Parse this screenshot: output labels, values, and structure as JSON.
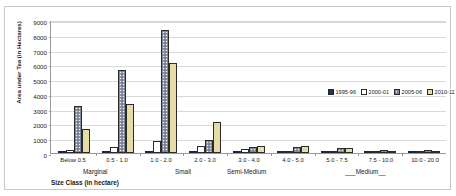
{
  "chart_data": {
    "type": "bar",
    "title": "",
    "xlabel": "Size Class (in hectare)",
    "ylabel": "Area under Tea (in Hectares)",
    "ylim": [
      0,
      9000
    ],
    "ystep": 1000,
    "yticks": [
      "9000",
      "8000",
      "7000",
      "6000",
      "5000",
      "4000",
      "3000",
      "2000",
      "1000",
      "0"
    ],
    "grid": true,
    "legend_position": "middle-right-inside",
    "categories": [
      "Below 0.5",
      "0.5 - 1.0",
      "1.0 - 2.0",
      "2.0 - 3.0",
      "3.0 - 4.0",
      "4.0 - 5.0",
      "5.0 - 7.5",
      "7.5 - 10.0",
      "10.0 - 20.0"
    ],
    "group_labels": [
      {
        "text": "Marginal",
        "left": 78,
        "top": 161
      },
      {
        "text": "Small",
        "left": 170,
        "top": 161
      },
      {
        "text": "Semi-Medium",
        "left": 222,
        "top": 161
      },
      {
        "text": "___Medium__",
        "left": 340,
        "top": 161
      }
    ],
    "series": [
      {
        "name": "1995-96",
        "color": "#26324f",
        "style": "solid-navy",
        "values": [
          0,
          0,
          0,
          0,
          0,
          0,
          0,
          0,
          0
        ]
      },
      {
        "name": "2000-01",
        "color": "#ffffff",
        "style": "white-outline",
        "values": [
          200,
          400,
          800,
          500,
          300,
          150,
          100,
          50,
          50
        ]
      },
      {
        "name": "2005-06",
        "color": "#8e97a8",
        "style": "speckled-grey",
        "values": [
          3150,
          5650,
          8300,
          900,
          400,
          400,
          350,
          200,
          200
        ]
      },
      {
        "name": "2010-11",
        "color": "#e6dda6",
        "style": "solid-tan",
        "values": [
          1620,
          3350,
          6100,
          2100,
          500,
          450,
          350,
          120,
          100
        ]
      }
    ]
  }
}
